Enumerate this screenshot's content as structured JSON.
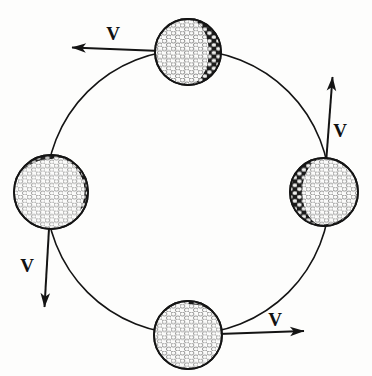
{
  "figure": {
    "background_color": "#fdfdfc",
    "ink_color": "#141414",
    "width": 372,
    "height": 376
  },
  "path": {
    "name": "circular-path",
    "shape": "circle",
    "center_x": 188,
    "center_y": 192,
    "radius": 142,
    "stroke_color": "#141414",
    "stroke_width": 1.6
  },
  "balls": [
    {
      "id": "ball-top",
      "label": "top golf ball",
      "cx": 188,
      "cy": 52,
      "r": 34,
      "shade_side": "right",
      "angle_deg": 90
    },
    {
      "id": "ball-right",
      "label": "right golf ball",
      "cx": 324,
      "cy": 192,
      "r": 35,
      "shade_side": "left",
      "angle_deg": 0
    },
    {
      "id": "ball-bottom",
      "label": "bottom golf ball",
      "cx": 188,
      "cy": 335,
      "r": 35,
      "shade_side": "upper-left",
      "angle_deg": 270
    },
    {
      "id": "ball-left",
      "label": "left golf ball",
      "cx": 51,
      "cy": 192,
      "r": 38,
      "shade_side": "upper-right",
      "angle_deg": 180
    }
  ],
  "vectors": [
    {
      "id": "vector-top",
      "label": "V",
      "direction": "left",
      "from_x": 186,
      "from_y": 52,
      "to_x": 68,
      "to_y": 47,
      "label_x": 113,
      "label_y": 37,
      "attached_ball": "ball-top"
    },
    {
      "id": "vector-right",
      "label": "V",
      "direction": "up",
      "from_x": 324,
      "from_y": 190,
      "to_x": 333,
      "to_y": 73,
      "label_x": 340,
      "label_y": 131,
      "attached_ball": "ball-right"
    },
    {
      "id": "vector-bottom",
      "label": "V",
      "direction": "right",
      "from_x": 190,
      "from_y": 335,
      "to_x": 308,
      "to_y": 331,
      "label_x": 274,
      "label_y": 321,
      "attached_ball": "ball-bottom"
    },
    {
      "id": "vector-left",
      "label": "V",
      "direction": "down",
      "from_x": 51,
      "from_y": 194,
      "to_x": 44,
      "to_y": 311,
      "label_x": 26,
      "label_y": 266,
      "attached_ball": "ball-left"
    }
  ],
  "vector_label_text": "V",
  "arrow": {
    "stroke_width": 2.0,
    "head_length": 15,
    "head_width": 9,
    "color": "#141414"
  }
}
